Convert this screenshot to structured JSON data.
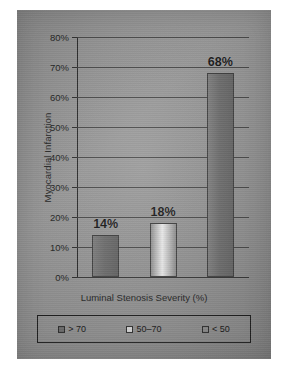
{
  "chart_data": {
    "type": "bar",
    "title": "",
    "xlabel": "Luminal Stenosis Severity (%)",
    "ylabel": "Myocardial Infarction",
    "categories": [
      "> 70",
      "50–70",
      "< 50"
    ],
    "values": [
      14,
      18,
      68
    ],
    "data_labels": [
      "14%",
      "18%",
      "68%"
    ],
    "ylim": [
      0,
      80
    ],
    "ytick_values": [
      0,
      10,
      20,
      30,
      40,
      50,
      60,
      70,
      80
    ],
    "ytick_labels": [
      "0%",
      "10%",
      "20%",
      "30%",
      "40%",
      "50%",
      "60%",
      "70%",
      "80%"
    ],
    "grid": "horizontal",
    "legend_position": "bottom",
    "legend_entries": [
      {
        "label": "> 70",
        "color": "#6d6d6d"
      },
      {
        "label": "50–70",
        "color": "#d8d8d8"
      },
      {
        "label": "< 50",
        "color": "#8a8a8a"
      }
    ],
    "bar_styles": [
      {
        "fill_start": "#7b7b7b",
        "fill_mid": "#6a6a6a",
        "fill_end": "#5f5f5f"
      },
      {
        "fill_start": "#8f8f8f",
        "fill_mid": "#ececec",
        "fill_end": "#8a8a8a"
      },
      {
        "fill_start": "#7e7e7e",
        "fill_mid": "#6b6b6b",
        "fill_end": "#636363"
      }
    ]
  },
  "figure": {
    "panel_background": "#919191",
    "axis_color": "#242424",
    "text_color": "#1b1b1b"
  }
}
